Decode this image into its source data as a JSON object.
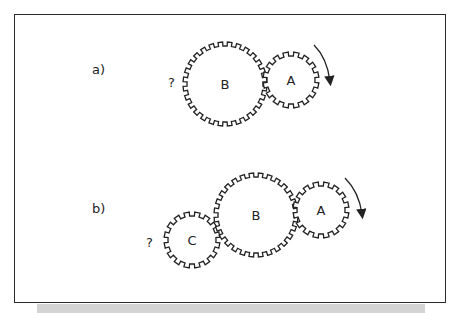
{
  "diagram": {
    "panels": [
      {
        "label": "a)",
        "label_pos": [
          92,
          74
        ],
        "question": "?",
        "question_pos": [
          168,
          87
        ],
        "gears": [
          {
            "name": "B",
            "cx": 225,
            "cy": 84,
            "r": 38,
            "teeth": 28
          },
          {
            "name": "A",
            "cx": 291,
            "cy": 80,
            "r": 24,
            "teeth": 16
          }
        ],
        "arrow": {
          "from": [
            314,
            45
          ],
          "ctrl": [
            327,
            58
          ],
          "to": [
            330,
            81
          ],
          "direction": "clockwise"
        }
      },
      {
        "label": "b)",
        "label_pos": [
          92,
          213
        ],
        "question": "?",
        "question_pos": [
          146,
          247
        ],
        "gears": [
          {
            "name": "C",
            "cx": 192,
            "cy": 240,
            "r": 24,
            "teeth": 16
          },
          {
            "name": "B",
            "cx": 256,
            "cy": 215,
            "r": 38,
            "teeth": 28
          },
          {
            "name": "A",
            "cx": 321,
            "cy": 210,
            "r": 24,
            "teeth": 16
          }
        ],
        "arrow": {
          "from": [
            345,
            178
          ],
          "ctrl": [
            359,
            192
          ],
          "to": [
            362,
            214
          ],
          "direction": "clockwise"
        }
      }
    ],
    "colors": {
      "stroke": "#222222",
      "frame": "#2a2a2a",
      "shadow": "#d4d4d4"
    }
  }
}
